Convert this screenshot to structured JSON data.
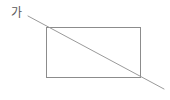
{
  "figure": {
    "kind": "geometry-figure",
    "background_color": "#ffffff",
    "canvas": {
      "width": 170,
      "height": 100
    },
    "labels": [
      {
        "id": "ga",
        "text": "가",
        "name": "label-ga",
        "color": "#5a5a5a",
        "x": 11,
        "y": 7
      }
    ],
    "shapes": {
      "rectangle": {
        "name": "rectangle",
        "stroke_color": "#8c8c8c",
        "stroke_width": 1,
        "fill": "none",
        "x": 46,
        "y": 27,
        "width": 94,
        "height": 50,
        "corners": {
          "top_left": [
            46,
            27
          ],
          "top_right": [
            140,
            27
          ],
          "bottom_right": [
            140,
            77
          ],
          "bottom_left": [
            46,
            77
          ]
        }
      },
      "diagonal_line": {
        "name": "diagonal-line",
        "stroke_color": "#9a9a9a",
        "stroke_width": 1,
        "x1": 28,
        "y1": 16,
        "x2": 164,
        "y2": 89,
        "passes_through": "rectangle top-left corner to bottom-right corner, extended at both ends"
      }
    }
  }
}
